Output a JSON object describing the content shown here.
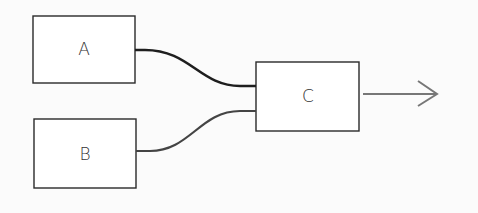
{
  "diagram": {
    "nodes": [
      {
        "id": "A",
        "label": "A",
        "x": 33,
        "y": 16,
        "w": 102,
        "h": 67
      },
      {
        "id": "B",
        "label": "B",
        "x": 34,
        "y": 119,
        "w": 102,
        "h": 69
      },
      {
        "id": "C",
        "label": "C",
        "x": 256,
        "y": 62,
        "w": 103,
        "h": 69
      }
    ],
    "edges": [
      {
        "from": "A",
        "to": "C"
      },
      {
        "from": "B",
        "to": "C"
      },
      {
        "from": "C",
        "to": "output",
        "arrow": true
      }
    ],
    "colors": {
      "box_stroke": "#2a2a2a",
      "wire": "#1e1e1e",
      "arrow": "#777777"
    }
  }
}
